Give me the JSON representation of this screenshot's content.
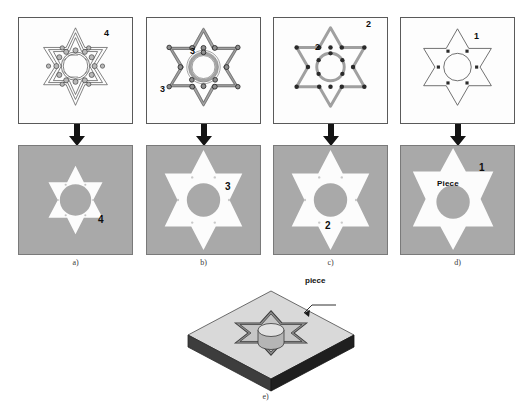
{
  "figure": {
    "colors": {
      "stock_grey": "#a9a9a9",
      "panel_white": "#fdfdfd",
      "frame": "#5a5a5a",
      "toolpath_grey": "#9b9b9b",
      "node_black": "#1a1a1a",
      "arrow_black": "#111111",
      "iso_top": "#d6d6d6",
      "iso_side": "#3a3a3a",
      "iso_pocket": "#8c8c8c"
    }
  },
  "panels": [
    {
      "id": "a",
      "caption": "a)",
      "step_number": "4",
      "top": {
        "name": "finishing-toolpath-panel",
        "description": "dense multi-contour finishing toolpath with many tool positions",
        "contours": 3,
        "tool_markers": 18,
        "label": "4"
      },
      "bottom": {
        "name": "machined-result-a",
        "description": "grey stock with small white star pocket and round boss",
        "label": "4"
      }
    },
    {
      "id": "b",
      "caption": "b)",
      "step_number": "3",
      "top": {
        "name": "semifinishing-toolpath-panel",
        "description": "offset star contour and inner circular contour toolpaths",
        "contours": 2,
        "tool_markers": 14,
        "label": "3"
      },
      "bottom": {
        "name": "machined-result-b",
        "description": "grey stock with large white star pocket and round boss",
        "label": "3"
      }
    },
    {
      "id": "c",
      "caption": "c)",
      "step_number": "2",
      "top": {
        "name": "roughing-toolpath-panel",
        "description": "single star contour and inner circle contour with node points",
        "contours": 2,
        "tool_markers": 13,
        "label": "2"
      },
      "bottom": {
        "name": "machined-result-c",
        "description": "grey stock with white star pocket and round boss",
        "label": "2"
      }
    },
    {
      "id": "d",
      "caption": "d)",
      "step_number": "1",
      "top": {
        "name": "geometry-definition-panel",
        "description": "star outline geometry with inner circle and six drill points",
        "contours": 2,
        "tool_markers": 6,
        "label": "1"
      },
      "bottom": {
        "name": "machined-result-d",
        "description": "grey stock with white star piece and round boss",
        "label": "1",
        "piece_label": "Piece"
      }
    }
  ],
  "iso": {
    "caption": "e)",
    "leader_label": "piece",
    "name": "isometric-machined-block",
    "description": "isometric view of rectangular block with star pocket and cylindrical boss"
  }
}
